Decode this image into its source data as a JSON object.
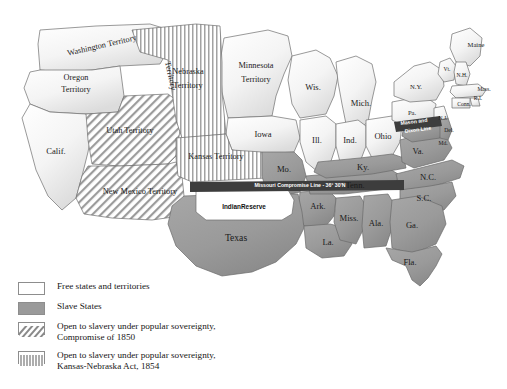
{
  "figure": {
    "kind": "historical-map",
    "background_color": "#ffffff"
  },
  "colors": {
    "free": "#ffffff",
    "slave": "#9a9a9a",
    "outline": "#4a4a4a",
    "border_internal": "#7a7a7a",
    "hatch": "#8a8a8a",
    "line_band": "#3d3d3d",
    "label_text": "#1a1a1a"
  },
  "map": {
    "lines": [
      {
        "id": "missouri-compromise-line",
        "label": "Missouri Compromise Line - 36° 30'N"
      },
      {
        "id": "mason-dixon-line",
        "label_line1": "Mason and",
        "label_line2": "Dixon Line"
      }
    ],
    "reserve": {
      "label": "IndianReserve"
    },
    "regions": [
      {
        "name": "Washington Territory",
        "label": "Washington Territory",
        "status": "free"
      },
      {
        "name": "Oregon Territory",
        "label": "Oregon\nTerritory",
        "status": "free"
      },
      {
        "name": "Minnesota Territory",
        "label": "Minnesota\nTerritory",
        "status": "free"
      },
      {
        "name": "Nebraska Territory",
        "label": "Nebraska\nTerritory",
        "status": "popular-sovereignty-1854"
      },
      {
        "name": "Kansas Territory",
        "label": "Kansas Territory",
        "status": "popular-sovereignty-1854"
      },
      {
        "name": "Utah Territory",
        "label": "Utah Territory",
        "status": "popular-sovereignty-1850"
      },
      {
        "name": "New Mexico Territory",
        "label": "New Mexico Territory",
        "status": "popular-sovereignty-1850"
      },
      {
        "name": "California",
        "label": "Calif.",
        "status": "free"
      },
      {
        "name": "Iowa",
        "label": "Iowa",
        "status": "free"
      },
      {
        "name": "Wisconsin",
        "label": "Wis.",
        "status": "free"
      },
      {
        "name": "Michigan",
        "label": "Mich.",
        "status": "free"
      },
      {
        "name": "Illinois",
        "label": "Ill.",
        "status": "free"
      },
      {
        "name": "Indiana",
        "label": "Ind.",
        "status": "free"
      },
      {
        "name": "Ohio",
        "label": "Ohio",
        "status": "free"
      },
      {
        "name": "Pennsylvania",
        "label": "Pa.",
        "status": "free"
      },
      {
        "name": "New York",
        "label": "N.Y.",
        "status": "free"
      },
      {
        "name": "Maine",
        "label": "Maine",
        "status": "free"
      },
      {
        "name": "Vermont",
        "label": "Vt.",
        "status": "free"
      },
      {
        "name": "New Hampshire",
        "label": "N.H.",
        "status": "free"
      },
      {
        "name": "Massachusetts",
        "label": "Mass.",
        "status": "free"
      },
      {
        "name": "Rhode Island",
        "label": "R.I.",
        "status": "free"
      },
      {
        "name": "Connecticut",
        "label": "Conn.",
        "status": "free"
      },
      {
        "name": "New Jersey",
        "label": "N.J.",
        "status": "free"
      },
      {
        "name": "Delaware",
        "label": "Del.",
        "status": "slave"
      },
      {
        "name": "Maryland",
        "label": "Md.",
        "status": "slave"
      },
      {
        "name": "Virginia",
        "label": "Va.",
        "status": "slave"
      },
      {
        "name": "North Carolina",
        "label": "N.C.",
        "status": "slave"
      },
      {
        "name": "South Carolina",
        "label": "S.C.",
        "status": "slave"
      },
      {
        "name": "Georgia",
        "label": "Ga.",
        "status": "slave"
      },
      {
        "name": "Florida",
        "label": "Fla.",
        "status": "slave"
      },
      {
        "name": "Alabama",
        "label": "Ala.",
        "status": "slave"
      },
      {
        "name": "Mississippi",
        "label": "Miss.",
        "status": "slave"
      },
      {
        "name": "Tennessee",
        "label": "Tenn.",
        "status": "slave"
      },
      {
        "name": "Kentucky",
        "label": "Ky.",
        "status": "slave"
      },
      {
        "name": "Missouri",
        "label": "Mo.",
        "status": "slave"
      },
      {
        "name": "Arkansas",
        "label": "Ark.",
        "status": "slave"
      },
      {
        "name": "Louisiana",
        "label": "La.",
        "status": "slave"
      },
      {
        "name": "Texas",
        "label": "Texas",
        "status": "slave"
      }
    ]
  },
  "legend": {
    "items": [
      {
        "swatch": "free",
        "text": "Free states and territories"
      },
      {
        "swatch": "slave",
        "text": "Slave States"
      },
      {
        "swatch": "diagonal-hatch",
        "text": "Open to slavery under popular sovereignty,\nCompromise of 1850"
      },
      {
        "swatch": "vertical-hatch",
        "text": "Open to slavery under popular sovereignty,\nKansas-Nebraska Act, 1854"
      }
    ]
  }
}
